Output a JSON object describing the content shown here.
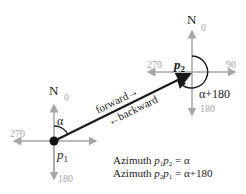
{
  "diagram": {
    "p1": {
      "label": "p",
      "subscript": "1",
      "north": "N",
      "deg_0": "0",
      "deg_270": "270",
      "deg_180": "180",
      "angle_label": "α"
    },
    "p2": {
      "label": "p",
      "subscript": "2",
      "north": "N",
      "deg_0": "0",
      "deg_270": "270",
      "deg_90": "90",
      "deg_180": "180",
      "angle_label": "α+180"
    },
    "line": {
      "forward_label": "forward",
      "backward_label": "backward"
    },
    "legend": {
      "line1_prefix": "Azimuth ",
      "line1_a": "p",
      "line1_a_sub": "1",
      "line1_b": "p",
      "line1_b_sub": "2",
      "line1_suffix": " = α",
      "line2_prefix": "Azimuth ",
      "line2_a": "p",
      "line2_a_sub": "2",
      "line2_b": "p",
      "line2_b_sub": "1",
      "line2_suffix": " = α+180"
    },
    "colors": {
      "axis": "#a6a6a6",
      "line": "#1a1a1a"
    }
  }
}
